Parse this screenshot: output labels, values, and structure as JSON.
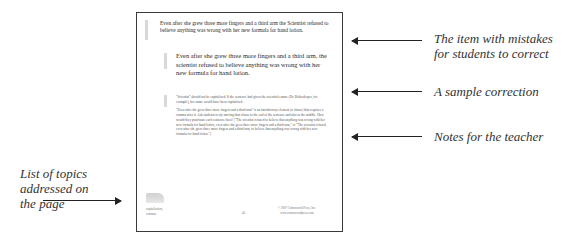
{
  "page": {
    "item_text": "Even after she grew three more fingers and a third arm the Scientist refused to believe anything was wrong with her new formula for hand lotion.",
    "correction_text": "Even after she grew three more fingers and a third arm, the scientist refused to believe anything was wrong with her new formula for hand lotion.",
    "notes": [
      "\"Scientist\" should not be capitalized. If the sentence had given the scientist's name (Dr. Birkenkoper, for example), her name would have been capitalized.",
      "\"Even after she grew three more fingers and a third arm\" is an introductory element (a clause) that requires a comma after it. Ask students to try moving that clause to the end of the sentence and also to the middle. How would they punctuate each sentence then? (\"The scientist refused to believe that anything was wrong with her new formula for hand lotion, even after she grew three more fingers and a third arm,\" or \"The scientist refused, even after she grew three more fingers and a third arm, to believe that anything was wrong with her new formula for hand lotion.\")"
    ],
    "topics": [
      "capitalization,",
      "commas"
    ],
    "page_number": "40",
    "copyright": "© 2007 Cottonwood Press, Inc.",
    "website": "www.cottonwoodpress.com"
  },
  "annotations": {
    "item": [
      "The item with mistakes",
      "for students to correct"
    ],
    "correction": "A sample correction",
    "notes": "Notes for the teacher",
    "topics": [
      "List of topics",
      "addressed on",
      "the page"
    ]
  }
}
